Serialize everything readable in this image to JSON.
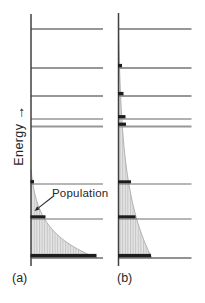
{
  "labels": {
    "energy": "Energy",
    "energy_arrow": "→",
    "population": "Population",
    "panel_a": "(a)",
    "panel_b": "(b)"
  },
  "colors": {
    "background": "#ffffff",
    "axis": "#404040",
    "level_line_upper": "#979797",
    "level_line_lower": "#6e6e6e",
    "population_bar": "#1d1d1d",
    "curve_fill": "#e4e4e4",
    "curve_hatch": "#c4c4c4",
    "curve_edge": "#ababab",
    "text": "#262626",
    "annotation_arrow": "#2a2a2a"
  },
  "diagram": {
    "width": 205,
    "height": 303,
    "panels": [
      {
        "id": "a",
        "axis_x": 31,
        "axis_top_y": 14,
        "axis_bottom_y": 266,
        "level_right_x": 103,
        "baseline_y": 258,
        "levels": [
          {
            "y": 29,
            "sw": 1.8,
            "tone": "upper"
          },
          {
            "y": 68,
            "sw": 1.8,
            "tone": "upper"
          },
          {
            "y": 96,
            "sw": 2.2,
            "tone": "upper"
          },
          {
            "y": 119,
            "sw": 1.4,
            "tone": "upper"
          },
          {
            "y": 126.5,
            "sw": 1.8,
            "tone": "upper"
          },
          {
            "y": 184,
            "sw": 1.1,
            "tone": "lower"
          },
          {
            "y": 219,
            "sw": 1.1,
            "tone": "lower"
          },
          {
            "y": 258,
            "sw": 1.3,
            "tone": "lower"
          }
        ],
        "curve": {
          "top_y": 169,
          "base_width": 66,
          "decay": 27
        },
        "population_bars": [
          {
            "level_y": 184,
            "width": 3.5,
            "height": 3.2
          },
          {
            "level_y": 219,
            "width": 15,
            "height": 3
          },
          {
            "level_y": 258,
            "width": 66,
            "height": 3.4
          }
        ]
      },
      {
        "id": "b",
        "axis_x": 118.5,
        "axis_top_y": 13,
        "axis_bottom_y": 266,
        "level_right_x": 191.5,
        "baseline_y": 258,
        "levels": [
          {
            "y": 29,
            "sw": 1.8,
            "tone": "upper"
          },
          {
            "y": 68,
            "sw": 1.8,
            "tone": "upper"
          },
          {
            "y": 96,
            "sw": 2.2,
            "tone": "upper"
          },
          {
            "y": 119,
            "sw": 1.4,
            "tone": "upper"
          },
          {
            "y": 126.5,
            "sw": 1.8,
            "tone": "upper"
          },
          {
            "y": 184,
            "sw": 1.1,
            "tone": "lower"
          },
          {
            "y": 219,
            "sw": 1.1,
            "tone": "lower"
          },
          {
            "y": 258,
            "sw": 1.3,
            "tone": "lower"
          }
        ],
        "curve": {
          "top_y": 14,
          "base_width": 33.5,
          "decay": 66
        },
        "population_bars": [
          {
            "level_y": 68,
            "width": 4,
            "height": 3.4
          },
          {
            "level_y": 96,
            "width": 5.5,
            "height": 3.4
          },
          {
            "level_y": 119,
            "width": 7.5,
            "height": 3.2
          },
          {
            "level_y": 126.5,
            "width": 8,
            "height": 3.2
          },
          {
            "level_y": 184,
            "width": 13,
            "height": 3
          },
          {
            "level_y": 219,
            "width": 17.5,
            "height": 3
          },
          {
            "level_y": 258,
            "width": 33,
            "height": 3.4
          }
        ]
      }
    ],
    "annotation": {
      "line_from": [
        53,
        196.5
      ],
      "arrow_tip": [
        34.5,
        211
      ]
    }
  }
}
